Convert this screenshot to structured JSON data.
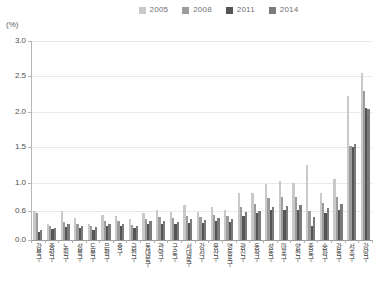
{
  "unit_label": "(%)",
  "legend": {
    "position": "top-center",
    "items": [
      {
        "label": "2005",
        "color": "#c9c9c9",
        "icon": "square-swatch-icon"
      },
      {
        "label": "2008",
        "color": "#9c9c9c",
        "icon": "square-swatch-icon"
      },
      {
        "label": "2011",
        "color": "#555555",
        "icon": "square-swatch-icon"
      },
      {
        "label": "2014",
        "color": "#7b7b7b",
        "icon": "square-swatch-icon"
      }
    ]
  },
  "chart_data": {
    "type": "bar",
    "title": "",
    "subtitle": "",
    "xlabel": "",
    "ylabel": "(%)",
    "ylim": [
      0,
      3.0
    ],
    "grid": true,
    "legend_position": "top-center",
    "ytick_labels": [
      "0.0",
      "0.6",
      "1.0",
      "1.5",
      "2.0",
      "2.5",
      "3.0"
    ],
    "ytick_values": [
      0.0,
      0.6,
      1.0,
      1.5,
      2.0,
      2.5,
      3.0
    ],
    "categories": [
      "강북구",
      "중랑구",
      "노원구",
      "성북구",
      "도봉구",
      "은평구",
      "중구",
      "금천구",
      "동대문구",
      "관악구",
      "구로구",
      "서대문구",
      "강서구",
      "용산구",
      "영등포구",
      "광진구",
      "동작구",
      "성동구",
      "마포구",
      "양천구",
      "종로구",
      "송파구",
      "강동구",
      "서초구",
      "강남구"
    ],
    "series": [
      {
        "name": "2005",
        "color": "#c9c9c9",
        "values": [
          0.6,
          0.33,
          0.6,
          0.46,
          0.33,
          0.52,
          0.5,
          0.43,
          0.55,
          0.62,
          0.58,
          0.68,
          0.58,
          0.65,
          0.62,
          0.85,
          0.86,
          0.98,
          1.02,
          1.0,
          1.25,
          0.85,
          1.05,
          2.22,
          2.55
        ]
      },
      {
        "name": "2008",
        "color": "#9c9c9c",
        "values": [
          0.56,
          0.3,
          0.38,
          0.34,
          0.3,
          0.4,
          0.4,
          0.32,
          0.44,
          0.47,
          0.45,
          0.5,
          0.47,
          0.52,
          0.5,
          0.66,
          0.7,
          0.78,
          0.8,
          0.8,
          0.6,
          0.72,
          0.8,
          1.52,
          2.3
        ]
      },
      {
        "name": "2011",
        "color": "#555555",
        "values": [
          0.16,
          0.22,
          0.26,
          0.24,
          0.21,
          0.28,
          0.3,
          0.24,
          0.34,
          0.34,
          0.33,
          0.36,
          0.35,
          0.4,
          0.38,
          0.5,
          0.55,
          0.62,
          0.62,
          0.62,
          0.3,
          0.56,
          0.62,
          1.5,
          2.06
        ]
      },
      {
        "name": "2014",
        "color": "#7b7b7b",
        "values": [
          0.2,
          0.24,
          0.34,
          0.28,
          0.26,
          0.33,
          0.34,
          0.29,
          0.4,
          0.4,
          0.38,
          0.43,
          0.41,
          0.46,
          0.44,
          0.58,
          0.6,
          0.66,
          0.67,
          0.68,
          0.48,
          0.64,
          0.7,
          1.55,
          2.04
        ]
      }
    ]
  }
}
